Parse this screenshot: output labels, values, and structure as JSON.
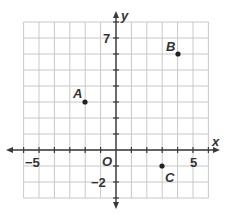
{
  "graph": {
    "x_axis_label": "x",
    "y_axis_label": "y",
    "origin_label": "O",
    "x_range": [
      -6,
      6
    ],
    "y_range": [
      -3,
      8
    ],
    "tick_labels": {
      "x_neg": "−5",
      "x_pos": "5",
      "y_pos": "7",
      "y_neg": "−2"
    },
    "points": [
      {
        "label": "A",
        "x": -2,
        "y": 3
      },
      {
        "label": "B",
        "x": 4,
        "y": 6
      },
      {
        "label": "C",
        "x": 3,
        "y": -1
      }
    ],
    "colors": {
      "grid": "#c8c8c8",
      "axis": "#3a3a3a",
      "point": "#222222"
    }
  }
}
